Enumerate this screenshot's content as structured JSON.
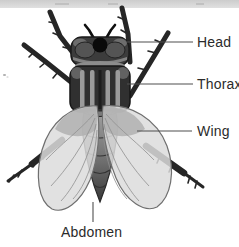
{
  "diagram": {
    "labels": [
      {
        "id": "head",
        "text": "Head"
      },
      {
        "id": "thorax",
        "text": "Thorax"
      },
      {
        "id": "wing",
        "text": "Wing"
      },
      {
        "id": "abdomen",
        "text": "Abdomen"
      }
    ],
    "colors": {
      "background": "#ffffff",
      "top_strip": "#d3d3d3",
      "label_text": "#2b2b2b",
      "leader_line": "#4f4f4f",
      "body_dark": "#303030",
      "body_stripe": "#9b9b9b",
      "wing_fill": "#dcdcdc",
      "wing_outline": "#6f6f6f",
      "leg": "#262626"
    }
  }
}
